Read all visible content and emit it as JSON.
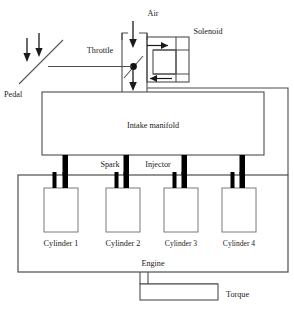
{
  "diagram": {
    "colors": {
      "line": "#4d4d4d",
      "bar": "#000000",
      "text": "#1a1a1a",
      "background": "#ffffff"
    },
    "labels": {
      "air": "Air",
      "solenoid": "Solenoid",
      "throttle": "Throttle",
      "pedal": "Pedal",
      "intake_manifold": "Intake manifold",
      "spark": "Spark",
      "injector": "Injector",
      "engine": "Engine",
      "torque": "Torque"
    },
    "cylinders": [
      {
        "label": "Cylinder 1"
      },
      {
        "label": "Cylinder 2"
      },
      {
        "label": "Cylinder 3"
      },
      {
        "label": "Cylinder 4"
      }
    ],
    "flow_arrows": [
      {
        "name": "air-inlet-arrow",
        "direction": "down"
      },
      {
        "name": "throttle-outlet-arrow",
        "direction": "down"
      },
      {
        "name": "pedal-arrow-left",
        "direction": "down"
      },
      {
        "name": "pedal-arrow-right",
        "direction": "down"
      },
      {
        "name": "solenoid-inlet-arrow",
        "direction": "right"
      },
      {
        "name": "solenoid-outlet-arrow",
        "direction": "left"
      }
    ]
  }
}
